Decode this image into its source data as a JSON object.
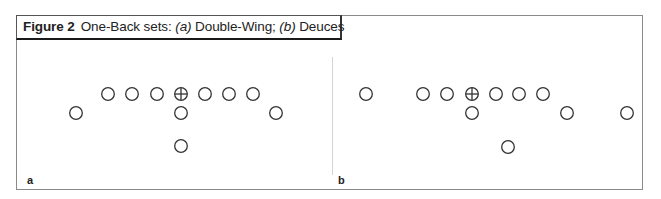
{
  "figure": {
    "number_label": "Figure 2",
    "title_prefix": "One-Back sets: ",
    "part_a_tag": "(a)",
    "part_a_name": " Double-Wing; ",
    "part_b_tag": "(b)",
    "part_b_name": " Deuces"
  },
  "panels": [
    {
      "label": "a",
      "name": "Double-Wing",
      "players": [
        {
          "role": "tackle-left",
          "x": 108,
          "y": 94,
          "center": false
        },
        {
          "role": "guard-left",
          "x": 132,
          "y": 94,
          "center": false
        },
        {
          "role": "lineman-left",
          "x": 157,
          "y": 94,
          "center": false
        },
        {
          "role": "center",
          "x": 181,
          "y": 94,
          "center": true
        },
        {
          "role": "lineman-right",
          "x": 205,
          "y": 94,
          "center": false
        },
        {
          "role": "guard-right",
          "x": 229,
          "y": 94,
          "center": false
        },
        {
          "role": "tackle-right",
          "x": 253,
          "y": 94,
          "center": false
        },
        {
          "role": "wing-left",
          "x": 76,
          "y": 113,
          "center": false
        },
        {
          "role": "quarterback",
          "x": 181,
          "y": 113,
          "center": false
        },
        {
          "role": "wing-right",
          "x": 276,
          "y": 113,
          "center": false
        },
        {
          "role": "running-back",
          "x": 181,
          "y": 146,
          "center": false
        }
      ]
    },
    {
      "label": "b",
      "name": "Deuces",
      "players": [
        {
          "role": "split-end",
          "x": 366,
          "y": 94,
          "center": false
        },
        {
          "role": "lineman-1",
          "x": 423,
          "y": 94,
          "center": false
        },
        {
          "role": "lineman-2",
          "x": 447,
          "y": 94,
          "center": false
        },
        {
          "role": "center",
          "x": 472,
          "y": 94,
          "center": true
        },
        {
          "role": "lineman-4",
          "x": 496,
          "y": 94,
          "center": false
        },
        {
          "role": "lineman-5",
          "x": 519,
          "y": 94,
          "center": false
        },
        {
          "role": "tight-end",
          "x": 543,
          "y": 94,
          "center": false
        },
        {
          "role": "quarterback",
          "x": 472,
          "y": 113,
          "center": false
        },
        {
          "role": "slot-receiver",
          "x": 567,
          "y": 113,
          "center": false
        },
        {
          "role": "wide-receiver",
          "x": 627,
          "y": 113,
          "center": false
        },
        {
          "role": "running-back",
          "x": 508,
          "y": 147,
          "center": false
        }
      ]
    }
  ],
  "colors": {
    "stroke": "#333333",
    "frame": "#8a8a8a",
    "divider": "#d4d4d4"
  }
}
